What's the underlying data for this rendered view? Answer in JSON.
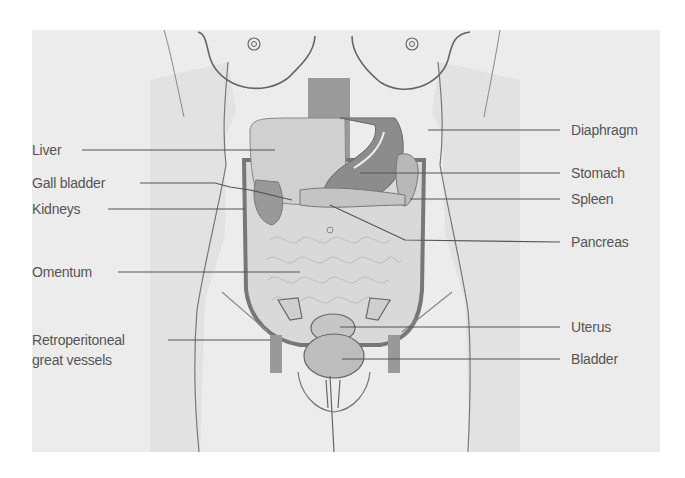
{
  "diagram": {
    "colors": {
      "panel": "#ececec",
      "body": "#dcdcdc",
      "outline": "#6a6a6a",
      "organ_dark": "#8a8a8a",
      "organ_mid": "#b4b4b4",
      "organ_light": "#d6d6d6",
      "label_text": "#555555",
      "leader_line": "#555555"
    },
    "labels_left": [
      {
        "id": "liver",
        "text": "Liver"
      },
      {
        "id": "gall-bladder",
        "text": "Gall bladder"
      },
      {
        "id": "kidneys",
        "text": "Kidneys"
      },
      {
        "id": "omentum",
        "text": "Omentum"
      },
      {
        "id": "retroperitoneal",
        "text": "Retroperitoneal",
        "text2": "great vessels"
      }
    ],
    "labels_right": [
      {
        "id": "diaphragm",
        "text": "Diaphragm"
      },
      {
        "id": "stomach",
        "text": "Stomach"
      },
      {
        "id": "spleen",
        "text": "Spleen"
      },
      {
        "id": "pancreas",
        "text": "Pancreas"
      },
      {
        "id": "uterus",
        "text": "Uterus"
      },
      {
        "id": "bladder",
        "text": "Bladder"
      }
    ]
  }
}
